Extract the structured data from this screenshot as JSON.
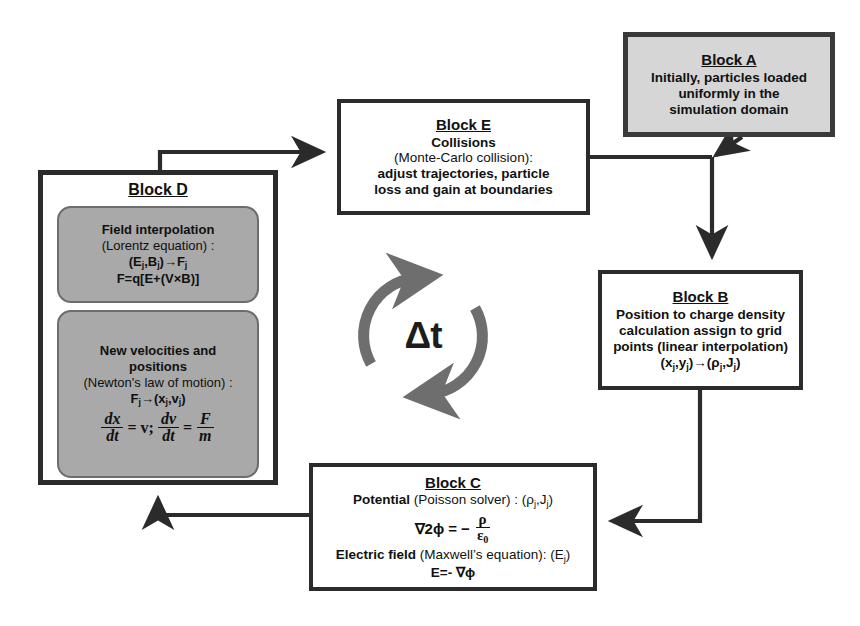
{
  "diagram": {
    "colors": {
      "line": "#2b2b2b",
      "block_a_fill": "#d6d6d6",
      "subbox_fill": "#a9a9a9",
      "arrow_gray": "#6e6e6e",
      "text": "#111111"
    },
    "cycle": {
      "label": "Δt",
      "name": "time-step-cycle"
    },
    "blocks": {
      "a": {
        "title": "Block A",
        "lines": [
          "Initially, particles loaded",
          "uniformly in the",
          "simulation domain"
        ]
      },
      "e": {
        "title": "Block E",
        "lines": [
          "Collisions",
          "(Monte-Carlo collision):",
          "adjust trajectories, particle",
          "loss and gain at boundaries"
        ]
      },
      "b": {
        "title": "Block B",
        "lines": [
          "Position to charge density",
          "calculation assign to grid",
          "points (linear interpolation)"
        ],
        "formula": "(xj,yj)→(ρj,Jj)"
      },
      "c": {
        "title": "Block C",
        "potential_label": "Potential",
        "potential_rest": " (Poisson solver) : (ρj,Jj)",
        "poisson_lhs": "∇2ϕ =",
        "poisson_minus": "−",
        "poisson_num": "ρ",
        "poisson_den": "ε0",
        "efield_label": "Electric field",
        "efield_rest": " (Maxwell's equation):  (Ej)",
        "efield_eq": "E=- ∇ϕ"
      },
      "d": {
        "title": "Block D",
        "sub_field": {
          "lines": [
            "Field interpolation",
            "(Lorentz equation) :"
          ],
          "formula1": "(Ej,Bj)→Fj",
          "formula2": "F=q[E+(V×B)]"
        },
        "sub_motion": {
          "lines": [
            "New velocities and",
            "positions",
            "(Newton's law of motion) :"
          ],
          "formula1": "Fj→(xj,vj)",
          "eq_dx_num": "dx",
          "eq_dx_den": "dt",
          "eq_mid": "= v;",
          "eq_dv_num": "dv",
          "eq_dv_den": "dt",
          "eq_eq": "=",
          "eq_F_num": "F",
          "eq_F_den": "m"
        }
      }
    },
    "connectors": [
      {
        "name": "arrow-d-to-e",
        "from": "Block D",
        "to": "Block E"
      },
      {
        "name": "arrow-e-to-junction",
        "from": "Block E",
        "to": "junction"
      },
      {
        "name": "arrow-a-to-junction",
        "from": "Block A",
        "to": "junction"
      },
      {
        "name": "arrow-junction-to-b",
        "from": "junction",
        "to": "Block B"
      },
      {
        "name": "arrow-b-to-c",
        "from": "Block B",
        "to": "Block C"
      },
      {
        "name": "arrow-c-to-d",
        "from": "Block C",
        "to": "Block D"
      }
    ]
  }
}
